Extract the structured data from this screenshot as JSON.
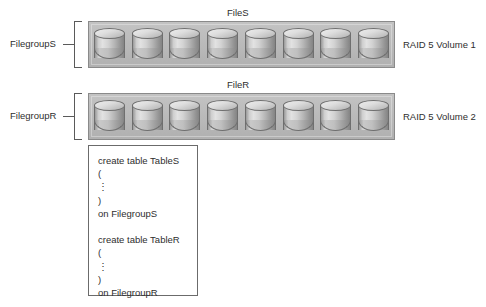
{
  "diagram": {
    "background_color": "#ffffff",
    "bar_fill_color": "#bcbcbc",
    "bar_border_color": "#8a8a8a",
    "text_color": "#2e2e2e"
  },
  "volumes": [
    {
      "file_label": "FileS",
      "filegroup_label": "FilegroupS",
      "raid_label": "RAID 5 Volume 1",
      "disk_count": 8,
      "disk_icon": "disk-cylinder-icon"
    },
    {
      "file_label": "FileR",
      "filegroup_label": "FilegroupR",
      "raid_label": "RAID 5 Volume 2",
      "disk_count": 8,
      "disk_icon": "disk-cylinder-icon"
    }
  ],
  "code_box": {
    "lines": [
      "create table TableS",
      "(",
      "⋮",
      ")",
      "on FilegroupS",
      "",
      "create table TableR",
      "(",
      "⋮",
      ")",
      "on FilegroupR"
    ]
  }
}
